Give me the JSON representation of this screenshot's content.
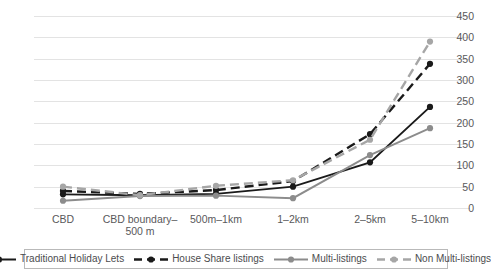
{
  "chart_data": {
    "type": "line",
    "title": "",
    "xlabel": "",
    "ylabel": "",
    "ylim": [
      0,
      450
    ],
    "ytick_step": 50,
    "grid": true,
    "legend_position": "bottom",
    "categories": [
      "CBD",
      "CBD boundary–\n500 m",
      "500m–1km",
      "1–2km",
      "2–5km",
      "5–10km"
    ],
    "yticks": [
      "0",
      "50",
      "100",
      "150",
      "200",
      "250",
      "300",
      "350",
      "400",
      "450"
    ],
    "series": [
      {
        "name": "Traditional Holiday Lets",
        "values": [
          32,
          30,
          33,
          50,
          107,
          237
        ],
        "color": "#1a1a1a",
        "dash": "solid",
        "marker": "circle"
      },
      {
        "name": "House Share listings",
        "values": [
          40,
          33,
          42,
          63,
          173,
          338
        ],
        "color": "#1a1a1a",
        "dash": "dashed",
        "marker": "circle"
      },
      {
        "name": "Multi-listings",
        "values": [
          17,
          28,
          29,
          23,
          124,
          187
        ],
        "color": "#8c8c8c",
        "dash": "solid",
        "marker": "circle"
      },
      {
        "name": "Non Multi-listings",
        "values": [
          50,
          30,
          52,
          65,
          160,
          390
        ],
        "color": "#a6a6a6",
        "dash": "dashed",
        "marker": "circle"
      }
    ]
  },
  "legend": {
    "items": [
      {
        "label": "Traditional Holiday Lets"
      },
      {
        "label": "House Share listings"
      },
      {
        "label": "Multi-listings"
      },
      {
        "label": "Non Multi-listings"
      }
    ]
  }
}
